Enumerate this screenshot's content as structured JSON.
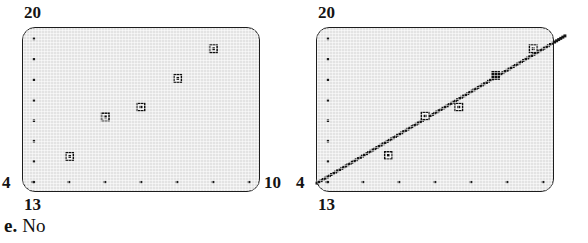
{
  "caption": {
    "letter": "e.",
    "text": "No"
  },
  "panels": [
    {
      "name": "scatter-plot-no-line",
      "axis": {
        "y_max_label": "20",
        "y_min_label": "4",
        "x_min_label": "13",
        "x_max_label": "10"
      },
      "show_regression_line": false,
      "y_tick_count": 8,
      "x_tick_count": 7,
      "markers": [
        {
          "x": 69,
          "y": 157,
          "style": "open"
        },
        {
          "x": 105,
          "y": 117,
          "style": "open"
        },
        {
          "x": 141,
          "y": 107,
          "style": "open"
        },
        {
          "x": 178,
          "y": 78,
          "style": "open"
        },
        {
          "x": 214,
          "y": 48,
          "style": "open"
        }
      ]
    },
    {
      "name": "scatter-plot-with-line",
      "axis": {
        "y_max_label": "20",
        "y_min_label": "4",
        "x_min_label": "13",
        "x_max_label": "10"
      },
      "show_regression_line": true,
      "y_tick_count": 8,
      "x_tick_count": 7,
      "markers": [
        {
          "x": 388,
          "y": 156,
          "style": "open"
        },
        {
          "x": 425,
          "y": 116,
          "style": "open"
        },
        {
          "x": 459,
          "y": 107,
          "style": "open"
        },
        {
          "x": 496,
          "y": 75,
          "style": "filled"
        },
        {
          "x": 534,
          "y": 48,
          "style": "open"
        }
      ],
      "line": {
        "x1": 316,
        "y1": 184,
        "x2": 566,
        "y2": 35
      }
    }
  ],
  "chart_data": {
    "type": "scatter",
    "title": "",
    "xlabel": "",
    "ylabel": "",
    "xlim": [
      13,
      10
    ],
    "ylim": [
      4,
      20
    ],
    "grid": false,
    "legend": null,
    "annotations": [
      "e. No"
    ],
    "panels": [
      {
        "label": "left",
        "description": "Scatter plot of residuals/data points without fitted line",
        "x": [
          13.5,
          14.1,
          14.7,
          15.3,
          15.9
        ],
        "y": [
          6.4,
          10.1,
          11.1,
          13.7,
          16.5
        ],
        "trend_line": false
      },
      {
        "label": "right",
        "description": "Scatter plot of same data with fitted straight line through the points",
        "x": [
          13.6,
          14.2,
          14.8,
          15.4,
          16.0
        ],
        "y": [
          6.5,
          10.2,
          11.1,
          14.1,
          16.6
        ],
        "trend_line": true,
        "trend_line_endpoints": {
          "x": [
            13.0,
            16.6
          ],
          "y": [
            4.4,
            18.8
          ]
        }
      }
    ]
  }
}
